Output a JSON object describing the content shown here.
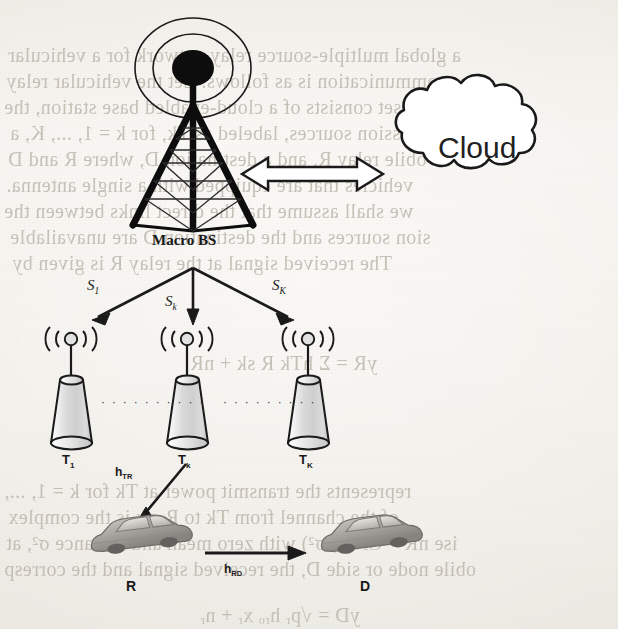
{
  "figure": {
    "type": "network-architecture-diagram",
    "background_color": "#f3f1ec",
    "ink_color": "#1a1a1a"
  },
  "nodes": {
    "macro_bs": {
      "label": "Macro BS",
      "role": "macro base station tower"
    },
    "cloud": {
      "label": "Cloud",
      "role": "cloud / core network"
    },
    "transmitters": [
      {
        "label": "T",
        "sub": "1"
      },
      {
        "label": "T",
        "sub": "k"
      },
      {
        "label": "T",
        "sub": "K"
      }
    ],
    "relay": {
      "label": "R",
      "role": "relay vehicle"
    },
    "destination": {
      "label": "D",
      "role": "destination vehicle"
    }
  },
  "links": {
    "backhaul": {
      "label": "",
      "style": "double-headed hollow arrow"
    },
    "signals": [
      {
        "label": "S",
        "sub": "1"
      },
      {
        "label": "S",
        "sub": "k"
      },
      {
        "label": "S",
        "sub": "K"
      }
    ],
    "channels": [
      {
        "label": "h",
        "sub": "TR",
        "from": "T",
        "to": "R"
      },
      {
        "label": "h",
        "sub": "RD",
        "from": "R",
        "to": "D"
      }
    ]
  },
  "ellipses": [
    {
      "dots": "· · · · · · · · · ·"
    },
    {
      "dots": "· · · · · · · · · ·"
    }
  ],
  "bleed_through": [
    {
      "text": "a global multiple-source relay network for a vehicular",
      "x": 8,
      "y": 44,
      "size": 20
    },
    {
      "text": "communication is as follows. Let the vehicular relay",
      "x": 6,
      "y": 70,
      "size": 20
    },
    {
      "text": "work set consists of a cloud-enabled base station, the",
      "x": 4,
      "y": 96,
      "size": 20
    },
    {
      "text": "mission sources, labeled as Tk, for k = 1, ..., K, a",
      "x": 10,
      "y": 122,
      "size": 20
    },
    {
      "text": "obile relay R, and a destination D, where R and D",
      "x": 8,
      "y": 148,
      "size": 20
    },
    {
      "text": "vehicles that are equipped with a single antenna.",
      "x": 6,
      "y": 174,
      "size": 20
    },
    {
      "text": "we shall assume that the direct links between the",
      "x": 4,
      "y": 200,
      "size": 20
    },
    {
      "text": "sion sources and the destination D are unavailable",
      "x": 10,
      "y": 226,
      "size": 20
    },
    {
      "text": "The received signal at the relay R is given by",
      "x": 12,
      "y": 252,
      "size": 20
    },
    {
      "text": "yR  =   Σ  hTk R sk  +  nR",
      "x": 190,
      "y": 352,
      "size": 20
    },
    {
      "text": "represents the transmit power at Tk for k = 1, ...,",
      "x": 4,
      "y": 480,
      "size": 20
    },
    {
      "text": "of the channel from Tk to R, sk is the complex",
      "x": 8,
      "y": 506,
      "size": 20
    },
    {
      "text": "ise nR ~ CN(0, σ²) with zero mean and variance σ², at",
      "x": 6,
      "y": 532,
      "size": 20
    },
    {
      "text": "obile node or side D, the received signal and the corresp",
      "x": 4,
      "y": 558,
      "size": 20
    },
    {
      "text": "yD  =  √pᵣ hᵣₒ xᵣ + nᵣ",
      "x": 200,
      "y": 604,
      "size": 20
    }
  ]
}
